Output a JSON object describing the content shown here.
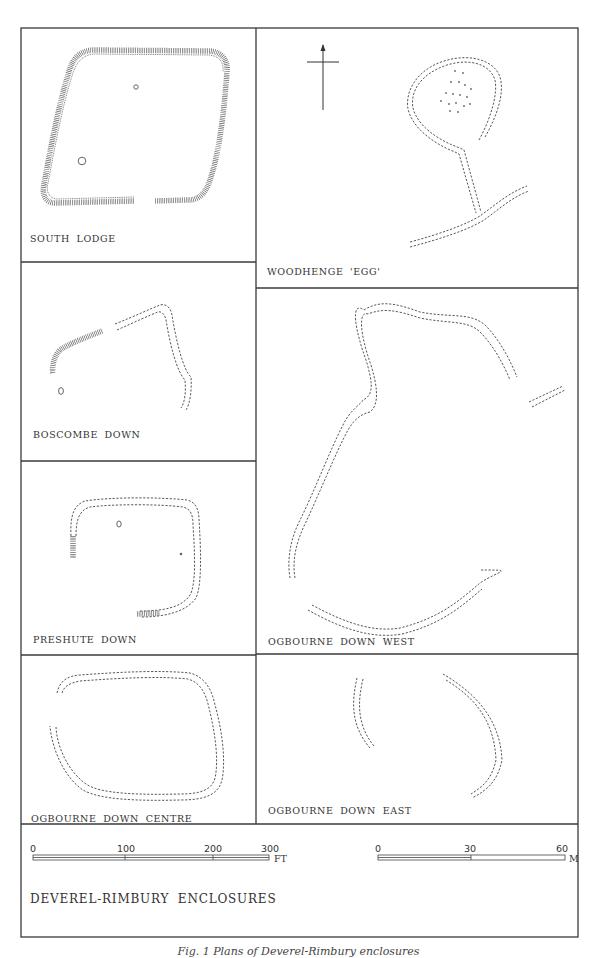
{
  "figure": {
    "title": "DEVEREL-RIMBURY ENCLOSURES",
    "caption": "Fig. 1 Plans of Deverel-Rimbury enclosures"
  },
  "panels": [
    {
      "id": "south-lodge",
      "label": "SOUTH LODGE"
    },
    {
      "id": "woodhenge-egg",
      "label": "WOODHENGE 'EGG'"
    },
    {
      "id": "boscombe-down",
      "label": "BOSCOMBE DOWN"
    },
    {
      "id": "ogbourne-down-west",
      "label": "OGBOURNE DOWN WEST"
    },
    {
      "id": "preshute-down",
      "label": "PRESHUTE DOWN"
    },
    {
      "id": "ogbourne-down-centre",
      "label": "OGBOURNE DOWN CENTRE"
    },
    {
      "id": "ogbourne-down-east",
      "label": "OGBOURNE DOWN EAST"
    }
  ],
  "north_arrow": {
    "icon": "north-arrow-icon"
  },
  "scale_bars": {
    "feet": {
      "ticks": [
        "0",
        "100",
        "200",
        "300"
      ],
      "unit": "FT",
      "max": 300
    },
    "metres": {
      "ticks": [
        "0",
        "30",
        "60"
      ],
      "unit": "M",
      "max": 60
    }
  }
}
